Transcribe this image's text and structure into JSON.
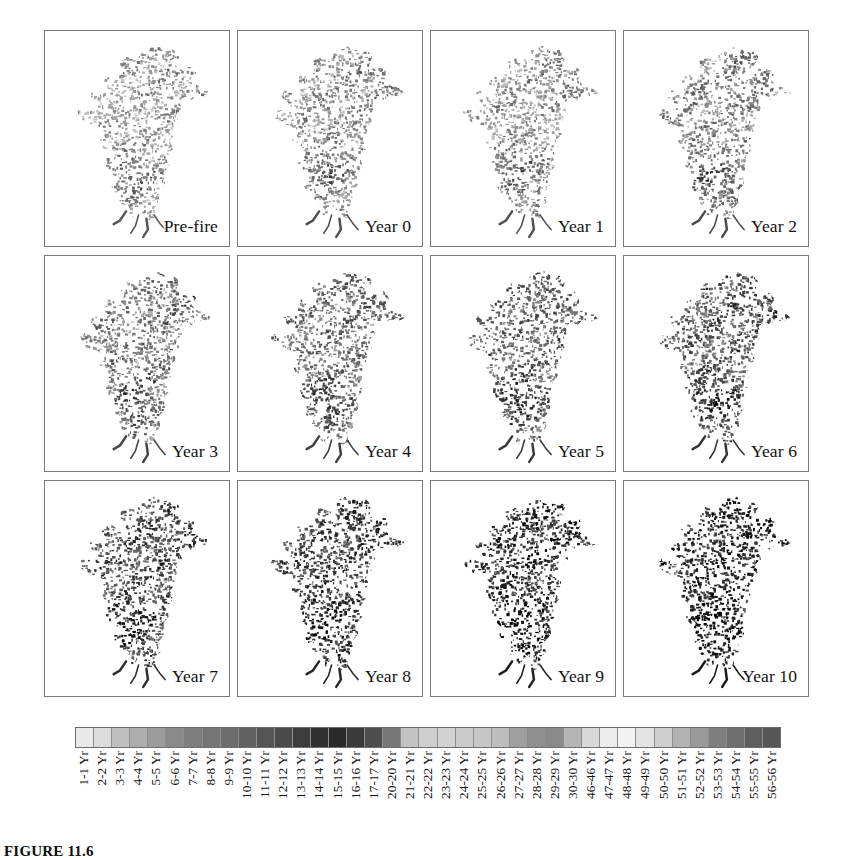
{
  "figure": {
    "caption_label": "FIGURE",
    "caption_number": "11.6",
    "background_color": "#ffffff",
    "panel_border_color": "#7a7a7a"
  },
  "panels": [
    {
      "label": "Pre-fire",
      "row": 1,
      "col": 1,
      "tone": 0.0
    },
    {
      "label": "Year 0",
      "row": 1,
      "col": 2,
      "tone": 0.1
    },
    {
      "label": "Year 1",
      "row": 1,
      "col": 3,
      "tone": 0.05
    },
    {
      "label": "Year 2",
      "row": 1,
      "col": 4,
      "tone": 0.16
    },
    {
      "label": "Year 3",
      "row": 2,
      "col": 1,
      "tone": 0.26
    },
    {
      "label": "Year 4",
      "row": 2,
      "col": 2,
      "tone": 0.32
    },
    {
      "label": "Year 5",
      "row": 2,
      "col": 3,
      "tone": 0.42
    },
    {
      "label": "Year 6",
      "row": 2,
      "col": 4,
      "tone": 0.5
    },
    {
      "label": "Year 7",
      "row": 3,
      "col": 1,
      "tone": 0.6
    },
    {
      "label": "Year 8",
      "row": 3,
      "col": 2,
      "tone": 0.7
    },
    {
      "label": "Year 9",
      "row": 3,
      "col": 3,
      "tone": 0.82
    },
    {
      "label": "Year 10",
      "row": 3,
      "col": 4,
      "tone": 0.92
    }
  ],
  "chart_data": {
    "type": "heatmap",
    "title": "",
    "xlabel": "",
    "ylabel": "",
    "grid": false,
    "legend_position": "bottom",
    "panel_sequence": [
      "Pre-fire",
      "Year 0",
      "Year 1",
      "Year 2",
      "Year 3",
      "Year 4",
      "Year 5",
      "Year 6",
      "Year 7",
      "Year 8",
      "Year 9",
      "Year 10"
    ],
    "legend_title": "",
    "categories": [
      "1-1 Yr",
      "2-2 Yr",
      "3-3 Yr",
      "4-4 Yr",
      "5-5 Yr",
      "6-6 Yr",
      "7-7 Yr",
      "8-8 Yr",
      "9-9 Yr",
      "10-10 Yr",
      "11-11 Yr",
      "12-12 Yr",
      "13-13 Yr",
      "14-14 Yr",
      "15-15 Yr",
      "16-16 Yr",
      "17-17 Yr",
      "20-20 Yr",
      "21-21 Yr",
      "22-22 Yr",
      "23-23 Yr",
      "24-24 Yr",
      "25-25 Yr",
      "26-26 Yr",
      "27-27 Yr",
      "28-28 Yr",
      "29-29 Yr",
      "30-30 Yr",
      "46-46 Yr",
      "47-47 Yr",
      "48-48 Yr",
      "49-49 Yr",
      "50-50 Yr",
      "51-51 Yr",
      "52-52 Yr",
      "53-53 Yr",
      "54-54 Yr",
      "55-55 Yr",
      "56-56 Yr"
    ],
    "colors": [
      "#e8e8e8",
      "#dcdcdc",
      "#bfbfbf",
      "#adadad",
      "#9c9c9c",
      "#8a8a8a",
      "#7e7e7e",
      "#757575",
      "#6c6c6c",
      "#616161",
      "#555555",
      "#4a4a4a",
      "#3c3c3c",
      "#303030",
      "#2a2a2a",
      "#3a3a3a",
      "#4e4e4e",
      "#777777",
      "#c2c2c2",
      "#cfcfcf",
      "#d2d2d2",
      "#cccccc",
      "#c6c6c6",
      "#bdbdbd",
      "#9f9f9f",
      "#8f8f8f",
      "#8a8a8a",
      "#b5b5b5",
      "#d8d8d8",
      "#ececec",
      "#f2f2f2",
      "#e3e3e3",
      "#cfcfcf",
      "#b2b2b2",
      "#9a9a9a",
      "#7f7f7f",
      "#6e6e6e",
      "#5e5e5e",
      "#565656"
    ]
  }
}
